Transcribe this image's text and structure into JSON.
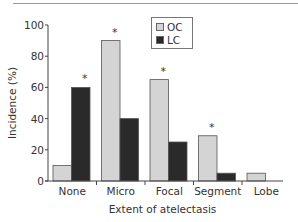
{
  "chart_data": {
    "type": "bar",
    "title": "",
    "xlabel": "Extent of atelectasis",
    "ylabel": "Incidence (%)",
    "ylim": [
      0,
      100
    ],
    "yticks": [
      0,
      20,
      40,
      60,
      80,
      100
    ],
    "categories": [
      "None",
      "Micro",
      "Focal",
      "Segment",
      "Lobe"
    ],
    "series": [
      {
        "name": "OC",
        "color": "#d4d4d4",
        "values": [
          10,
          90,
          65,
          29,
          5
        ]
      },
      {
        "name": "LC",
        "color": "#2a2a2a",
        "values": [
          60,
          40,
          25,
          5,
          0
        ]
      }
    ],
    "annotations": [
      {
        "category": "None",
        "series": "LC",
        "text": "*"
      },
      {
        "category": "Micro",
        "series": "OC",
        "text": "*"
      },
      {
        "category": "Focal",
        "series": "OC",
        "text": "*"
      },
      {
        "category": "Segment",
        "series": "OC",
        "text": "*"
      }
    ],
    "grid": false,
    "legend_position": "upper center"
  },
  "legend": {
    "items": [
      {
        "label": "OC",
        "color": "#d4d4d4"
      },
      {
        "label": "LC",
        "color": "#2a2a2a"
      }
    ]
  },
  "axes": {
    "x_title": "Extent of atelectasis",
    "y_title": "Incidence (%)",
    "y_tick_labels": [
      "0",
      "20",
      "40",
      "60",
      "80",
      "100"
    ],
    "x_tick_labels": [
      "None",
      "Micro",
      "Focal",
      "Segment",
      "Lobe"
    ]
  }
}
